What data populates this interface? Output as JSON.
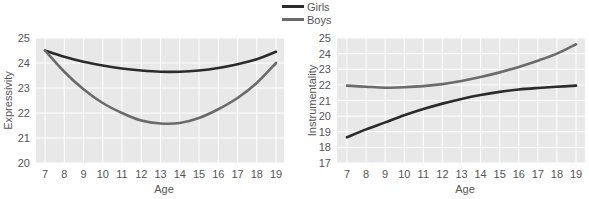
{
  "legend": {
    "items": [
      {
        "label": "Girls",
        "color": "#2b2b2b"
      },
      {
        "label": "Boys",
        "color": "#6b6b6b"
      }
    ]
  },
  "chart_data": [
    {
      "type": "line",
      "title": "",
      "xlabel": "Age",
      "ylabel": "Expressivity",
      "x": [
        7,
        8,
        9,
        10,
        11,
        12,
        13,
        14,
        15,
        16,
        17,
        18,
        19
      ],
      "xlim": [
        7,
        19
      ],
      "ylim": [
        20,
        25
      ],
      "yticks": [
        20,
        21,
        22,
        23,
        24,
        25
      ],
      "grid": true,
      "series": [
        {
          "name": "Girls",
          "values": [
            24.5,
            24.25,
            24.05,
            23.9,
            23.78,
            23.7,
            23.65,
            23.65,
            23.7,
            23.8,
            23.95,
            24.15,
            24.45
          ]
        },
        {
          "name": "Boys",
          "values": [
            24.5,
            23.65,
            22.95,
            22.4,
            22.0,
            21.7,
            21.58,
            21.6,
            21.8,
            22.15,
            22.6,
            23.2,
            24.0
          ]
        }
      ]
    },
    {
      "type": "line",
      "title": "",
      "xlabel": "Age",
      "ylabel": "Instrumentality",
      "x": [
        7,
        8,
        9,
        10,
        11,
        12,
        13,
        14,
        15,
        16,
        17,
        18,
        19
      ],
      "xlim": [
        7,
        19
      ],
      "ylim": [
        17,
        25
      ],
      "yticks": [
        17,
        18,
        19,
        20,
        21,
        22,
        23,
        24,
        25
      ],
      "grid": true,
      "series": [
        {
          "name": "Girls",
          "values": [
            18.65,
            19.15,
            19.6,
            20.05,
            20.45,
            20.8,
            21.1,
            21.35,
            21.55,
            21.7,
            21.8,
            21.88,
            21.95
          ]
        },
        {
          "name": "Boys",
          "values": [
            21.95,
            21.88,
            21.82,
            21.85,
            21.92,
            22.05,
            22.25,
            22.5,
            22.8,
            23.15,
            23.55,
            24.0,
            24.6
          ]
        }
      ]
    }
  ]
}
